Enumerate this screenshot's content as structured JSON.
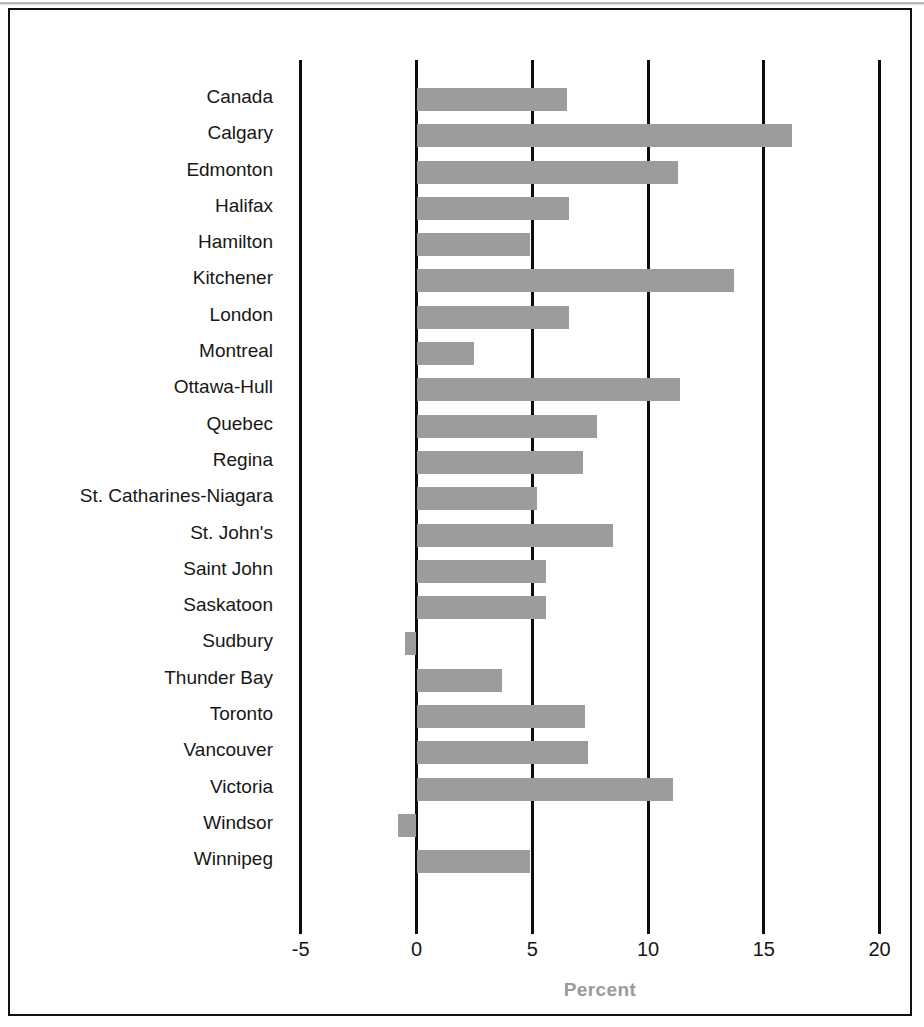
{
  "chart_data": {
    "type": "bar",
    "orientation": "horizontal",
    "title": "",
    "subtitle": "",
    "xlabel": "Percent",
    "ylabel": "",
    "xlim": [
      -5,
      20
    ],
    "xticks": [
      -5,
      0,
      5,
      10,
      15,
      20
    ],
    "xtick_labels": [
      "-5",
      "0",
      "5",
      "10",
      "15",
      "20"
    ],
    "grid": true,
    "gridline_orientation": "vertical",
    "legend": null,
    "bar_color": "#9c9c9c",
    "axis_color": "#0d0d0d",
    "categories": [
      "Canada",
      "Calgary",
      "Edmonton",
      "Halifax",
      "Hamilton",
      "Kitchener",
      "London",
      "Montreal",
      "Ottawa-Hull",
      "Quebec",
      "Regina",
      "St. Catharines-Niagara",
      "St. John's",
      "Saint John",
      "Saskatoon",
      "Sudbury",
      "Thunder Bay",
      "Toronto",
      "Vancouver",
      "Victoria",
      "Windsor",
      "Winnipeg"
    ],
    "values": [
      6.5,
      16.2,
      11.3,
      6.6,
      4.9,
      13.7,
      6.6,
      2.5,
      11.4,
      7.8,
      7.2,
      5.2,
      8.5,
      5.6,
      5.6,
      -0.5,
      3.7,
      7.3,
      7.4,
      11.1,
      -0.8,
      4.9
    ]
  },
  "axis": {
    "xlabel": "Percent"
  }
}
